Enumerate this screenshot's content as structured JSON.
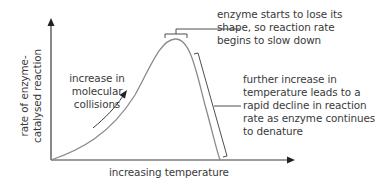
{
  "diagram": {
    "y_axis_label": [
      "rate of enzyme-",
      "catalysed reaction"
    ],
    "x_axis_label": "increasing temperature",
    "annotations": {
      "rise": [
        "increase in",
        "molecular",
        "collisions"
      ],
      "peak": [
        "enzyme starts to lose its",
        "shape, so reaction rate",
        "begins to slow down"
      ],
      "decline": [
        "further increase in",
        "temperature leads to a",
        "rapid decline in reaction",
        "rate as enzyme continues",
        "to denature"
      ]
    },
    "colors": {
      "axis": "#3a3a3a",
      "curve": "#8a8a8a",
      "text": "#3a3a3a"
    }
  }
}
